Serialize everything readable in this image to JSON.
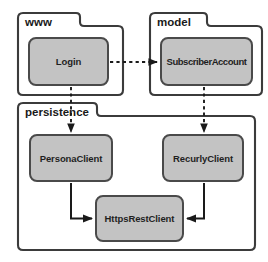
{
  "diagram": {
    "type": "uml-package-diagram",
    "title": "",
    "colors": {
      "component_fill": "#c3c3c3",
      "component_stroke": "#4a4a4a",
      "package_stroke": "#3b3b3b",
      "connector": "#1a1a1a",
      "background": "#ffffff",
      "text": "#1a1a1a"
    },
    "packages": [
      {
        "id": "www",
        "label": "www"
      },
      {
        "id": "model",
        "label": "model"
      },
      {
        "id": "persistence",
        "label": "persistence"
      }
    ],
    "components": [
      {
        "id": "login",
        "label": "Login",
        "package": "www"
      },
      {
        "id": "subscriber_account",
        "label": "SubscriberAccount",
        "package": "model"
      },
      {
        "id": "persona_client",
        "label": "PersonaClient",
        "package": "persistence"
      },
      {
        "id": "recurly_client",
        "label": "RecurlyClient",
        "package": "persistence"
      },
      {
        "id": "https_rest_client",
        "label": "HttpsRestClient",
        "package": "persistence"
      }
    ],
    "connectors": [
      {
        "from": "login",
        "to": "subscriber_account",
        "style": "dashed",
        "arrow": "filled"
      },
      {
        "from": "login",
        "to": "persona_client",
        "style": "dashed",
        "arrow": "filled"
      },
      {
        "from": "subscriber_account",
        "to": "recurly_client",
        "style": "dashed",
        "arrow": "filled"
      },
      {
        "from": "persona_client",
        "to": "https_rest_client",
        "style": "solid",
        "arrow": "filled"
      },
      {
        "from": "recurly_client",
        "to": "https_rest_client",
        "style": "solid",
        "arrow": "filled"
      }
    ]
  }
}
